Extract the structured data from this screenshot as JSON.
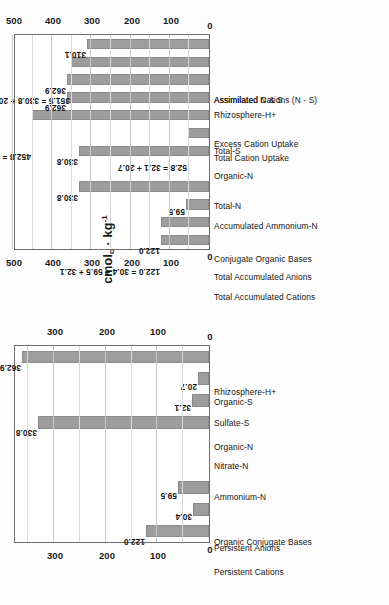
{
  "figure": {
    "background": "#fdfdfd",
    "bar_color": "#9d9d9d",
    "grid_color": "#c9c9c9",
    "axis_color": "#6f6f6f"
  },
  "axis_title": {
    "main": "cmol",
    "sub": "c",
    "mid": " · kg",
    "sup": "-1"
  },
  "chart_data": [
    {
      "id": "panel_a",
      "type": "bar",
      "title": "",
      "xlabel": "",
      "ylabel": "cmol_c · kg^-1",
      "ylim": [
        0,
        500
      ],
      "yticks": [
        0,
        100,
        200,
        300,
        400,
        500
      ],
      "grid": true,
      "minor_grid": true,
      "legend": "none",
      "orientation": "rotated-90",
      "categories": [
        "Total Accumulated Cations",
        "Total Accumulated Anions",
        "Conjugate Organic Bases",
        "Total-N",
        "Accumulated Ammonium-N",
        "Organic-N",
        "Total-S",
        "Total Cation Uptake",
        "Excess Cation Uptake",
        "Rhizosphere-H+",
        "Assimilated N & S",
        "Assimilated Cations (N - S)"
      ],
      "values": [
        122.0,
        122.0,
        59.5,
        330.8,
        0,
        330.8,
        52.8,
        452.8,
        362.9,
        362.9,
        351.5,
        310.1
      ],
      "data_labels": [
        "122.0",
        "122.0 = 30.4 + 59.5 + 32.1",
        "59.5",
        "330.8",
        "",
        "330.8",
        "52.8 = 32.1 + 20.7",
        "452.8 = 122.0 + 330.8",
        "362.9",
        "362.9",
        "351.5 = 330.8 + 20.7",
        "310.1"
      ]
    },
    {
      "id": "panel_b",
      "type": "bar",
      "title": "",
      "xlabel": "",
      "ylabel": "cmol_c · kg^-1",
      "ylim": [
        0,
        380
      ],
      "yticks": [
        0,
        100,
        200,
        300
      ],
      "grid": true,
      "minor_grid": true,
      "legend": "none",
      "orientation": "rotated-90",
      "categories": [
        "Persistent Cations",
        "Persistent Anions",
        "Organic Conjugate Bases",
        "Ammonium-N",
        "Nitrate-N",
        "Organic-N",
        "Sulfate-S",
        "Organic-S",
        "Rhizosphere-H+"
      ],
      "values": [
        122.0,
        30.4,
        59.5,
        0,
        0,
        330.8,
        32.1,
        20.7,
        362.9
      ],
      "data_labels": [
        "122.0",
        "30.4",
        "59.5",
        "",
        "",
        "330.8",
        "32.1",
        "20.7",
        "362.9"
      ]
    }
  ]
}
